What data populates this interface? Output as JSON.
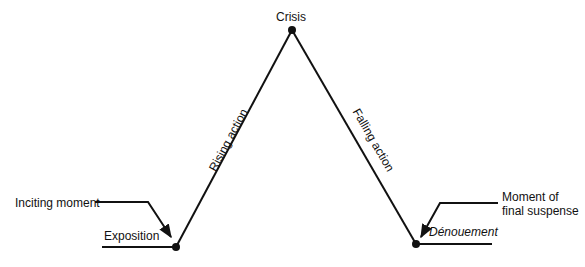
{
  "diagram": {
    "nodes": {
      "crisis": "Crisis",
      "exposition": "Exposition",
      "denouement": "Dénouement"
    },
    "edges": {
      "rising": "Rising action",
      "falling": "Falling action"
    },
    "annotations": {
      "inciting": "Inciting moment",
      "final_suspense_line1": "Moment of",
      "final_suspense_line2": "final suspense"
    },
    "line_color": "#111111"
  }
}
